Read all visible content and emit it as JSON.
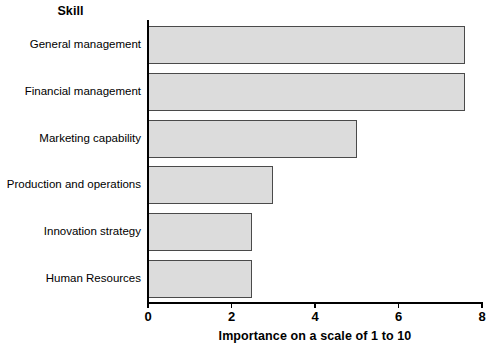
{
  "chart_data": {
    "type": "bar",
    "orientation": "horizontal",
    "title": "",
    "category_axis_title": "Skill",
    "xlabel": "Importance on a scale of 1 to 10",
    "ylabel": "Skill",
    "xlim": [
      0,
      8
    ],
    "xticks": [
      0,
      2,
      4,
      6,
      8
    ],
    "xtick_labels": [
      "0",
      "2",
      "4",
      "6",
      "8"
    ],
    "grid": false,
    "legend": false,
    "bar_fill_color": "#dcdcdc",
    "bar_border_color": "#4a4a4a",
    "background_color": "#ffffff",
    "categories": [
      "General management",
      "Financial management",
      "Marketing capability",
      "Production and operations",
      "Innovation strategy",
      "Human Resources"
    ],
    "values": [
      7.6,
      7.6,
      5.0,
      3.0,
      2.5,
      2.5
    ],
    "series": [
      {
        "name": "Importance",
        "values": [
          7.6,
          7.6,
          5.0,
          3.0,
          2.5,
          2.5
        ]
      }
    ]
  }
}
